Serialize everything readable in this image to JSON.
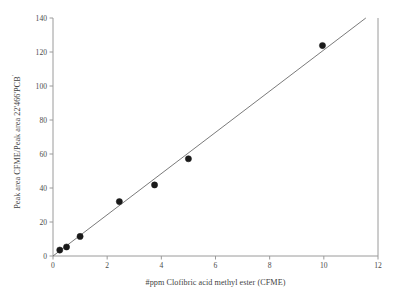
{
  "chart_data": {
    "type": "scatter",
    "title": "",
    "xlabel": "#ppm Clofibric acid methyl ester (CFME)",
    "ylabel_main": "Peak area CFME/Peak area 22'466'PCB",
    "ylabel_prefix": "Peak area CFME/Peak area 22'466'PCB",
    "ylabel_superscript": "'",
    "xlim": [
      0,
      12
    ],
    "ylim": [
      0,
      140
    ],
    "xticks": [
      0,
      2,
      4,
      6,
      8,
      10,
      12
    ],
    "yticks": [
      0,
      20,
      40,
      60,
      80,
      100,
      120,
      140
    ],
    "xtick_labels": [
      "0",
      "2",
      "4",
      "6",
      "8",
      "10",
      "12"
    ],
    "ytick_labels": [
      "0",
      "20",
      "40",
      "60",
      "80",
      "100",
      "120",
      "140"
    ],
    "grid": false,
    "legend": false,
    "marker": "filled-circle",
    "marker_color": "#1a1a1a",
    "line_color": "#6b6b6b",
    "axis_color": "#9a9a9a",
    "series": [
      {
        "name": "CFME calibration",
        "x": [
          0.25,
          0.5,
          1.0,
          2.45,
          3.75,
          5.0,
          9.95
        ],
        "y": [
          3.5,
          5.3,
          11.5,
          32.0,
          41.8,
          57.2,
          123.8
        ]
      }
    ],
    "fit_line": {
      "name": "linear regression",
      "x0": 0.0,
      "y0": 0.0,
      "x1": 11.55,
      "y1": 140.0,
      "slope": 12.12,
      "intercept": 0.0
    }
  },
  "axes": {
    "left_spine": true,
    "bottom_spine": true,
    "right_spine": true,
    "top_spine": false
  }
}
